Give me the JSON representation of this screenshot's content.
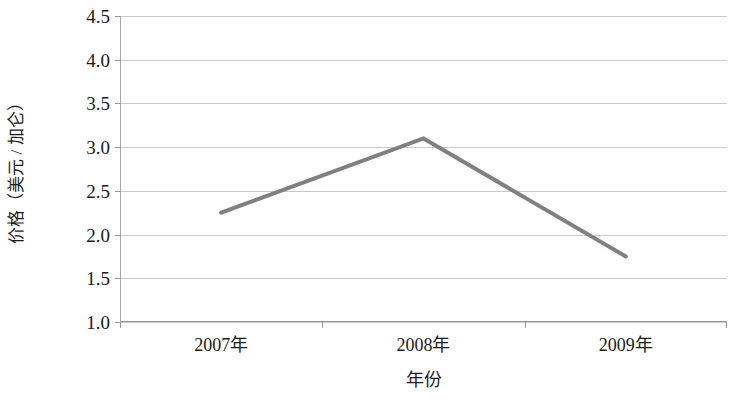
{
  "chart_data": {
    "type": "line",
    "title": "",
    "categories": [
      "2007年",
      "2008年",
      "2009年"
    ],
    "values": [
      2.25,
      3.1,
      1.75
    ],
    "series": [
      {
        "name": "价格",
        "values": [
          2.25,
          3.1,
          1.75
        ],
        "color": "#808080"
      }
    ],
    "xlabel": "年份",
    "ylabel": "价格（美元 / 加仑）",
    "ylim": [
      1.0,
      4.5
    ],
    "ytick_values": [
      4.5,
      4.0,
      3.5,
      3.0,
      2.5,
      2.0,
      1.5,
      1.0
    ],
    "ytick_labels": [
      "4.5",
      "4.0",
      "3.5",
      "3.0",
      "2.5",
      "2.0",
      "1.5",
      "1.0"
    ],
    "xtick_labels": [
      "2007年",
      "2008年",
      "2009年"
    ],
    "grid": true,
    "grid_axis": "y",
    "grid_color": "#c9c9c9",
    "legend": false,
    "legend_position": "none",
    "line_color": "#808080",
    "line_width_px": 4,
    "markers": false,
    "plot_background": "#ffffff",
    "axis_color": "#9a9a9a"
  },
  "axes": {
    "y_title": "价格（美元 / 加仑）",
    "x_title": "年份",
    "y_ticks": [
      "4.5",
      "4.0",
      "3.5",
      "3.0",
      "2.5",
      "2.0",
      "1.5",
      "1.0"
    ],
    "x_ticks": [
      "2007年",
      "2008年",
      "2009年"
    ]
  }
}
